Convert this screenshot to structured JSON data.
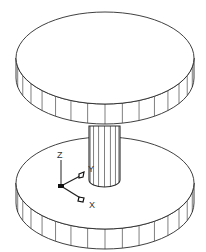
{
  "caption": "top part of caption (clipped)",
  "model": {
    "description": "Isometric wireframe of two disks joined by a cylindrical shaft",
    "top_disk": {
      "cx": 105,
      "cy": 58,
      "rx": 89,
      "ry": 46,
      "thickness": 20,
      "segments": 32
    },
    "bottom_disk": {
      "cx": 105,
      "cy": 183,
      "rx": 89,
      "ry": 46,
      "thickness": 20,
      "segments": 32
    },
    "shaft": {
      "cx": 104.5,
      "rx": 15.5,
      "ry": 7,
      "top_y": 126,
      "bottom_y": 180,
      "segments": 8
    }
  },
  "ucs_icon": {
    "origin": [
      61,
      186
    ],
    "labels": {
      "z": "Z",
      "y": "Y",
      "x": "X"
    }
  },
  "colors": {
    "line": "#2a2a2a",
    "fill": "#ffffff",
    "marker": "#111111"
  }
}
